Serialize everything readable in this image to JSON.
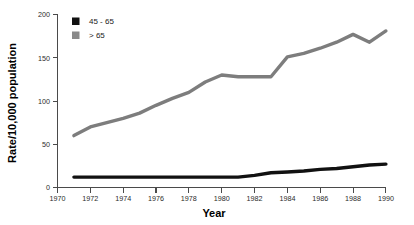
{
  "chart_data": {
    "type": "line",
    "title": "",
    "xlabel": "Year",
    "ylabel": "Rate/10,000 population",
    "xlim": [
      1970,
      1990
    ],
    "ylim": [
      0,
      200
    ],
    "xticks": [
      1970,
      1972,
      1974,
      1976,
      1978,
      1980,
      1982,
      1984,
      1986,
      1988,
      1990
    ],
    "yticks": [
      0,
      50,
      100,
      150,
      200
    ],
    "grid": false,
    "legend_position": "top-left",
    "x": [
      1971,
      1972,
      1973,
      1974,
      1975,
      1976,
      1977,
      1978,
      1979,
      1980,
      1981,
      1982,
      1983,
      1984,
      1985,
      1986,
      1987,
      1988,
      1989,
      1990
    ],
    "series": [
      {
        "name": "45 - 65",
        "color": "#111111",
        "linewidth": 3.4,
        "values": [
          12,
          12,
          12,
          12,
          12,
          12,
          12,
          12,
          12,
          12,
          12,
          14,
          17,
          18,
          19,
          21,
          22,
          24,
          26,
          27
        ]
      },
      {
        "name": "> 65",
        "color": "#7d7d7d",
        "linewidth": 3.4,
        "values": [
          60,
          70,
          75,
          80,
          86,
          95,
          103,
          110,
          122,
          130,
          128,
          128,
          128,
          151,
          155,
          161,
          168,
          177,
          168,
          181
        ]
      }
    ]
  },
  "legend": {
    "entries": [
      {
        "label": "45 - 65",
        "color": "#111111"
      },
      {
        "label": "> 65",
        "color": "#8a8a8a"
      }
    ]
  },
  "axes": {
    "y_title": "Rate/10,000 population",
    "x_title": "Year",
    "y_tick_labels": [
      "200",
      "150",
      "100",
      "50",
      "0"
    ],
    "x_tick_labels": [
      "1970",
      "1972",
      "1974",
      "1976",
      "1978",
      "1980",
      "1982",
      "1984",
      "1986",
      "1988",
      "1990"
    ]
  }
}
